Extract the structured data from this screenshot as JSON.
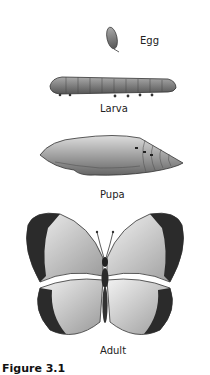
{
  "stages": [
    {
      "id": "egg",
      "label": "Egg"
    },
    {
      "id": "larva",
      "label": "Larva"
    },
    {
      "id": "pupa",
      "label": "Pupa"
    },
    {
      "id": "adult",
      "label": "Adult"
    }
  ],
  "caption": "Figure 3.1"
}
